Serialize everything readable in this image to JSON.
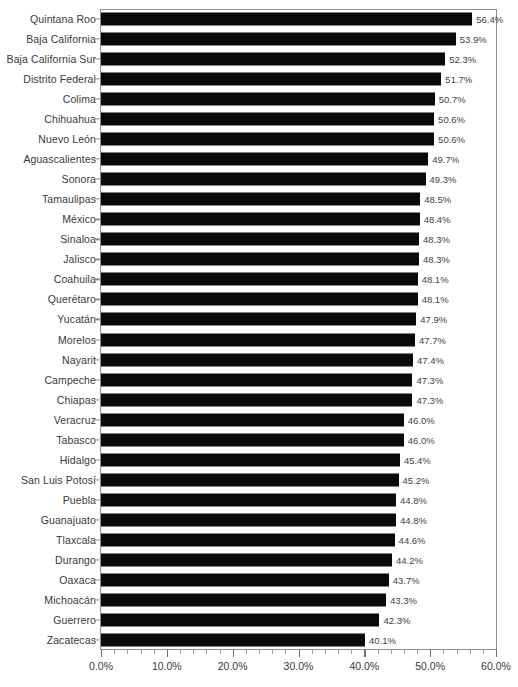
{
  "chart_data": {
    "type": "bar",
    "orientation": "horizontal",
    "title": "",
    "subtitle": "",
    "xlabel": "",
    "ylabel": "",
    "xlim": [
      0,
      60
    ],
    "grid": false,
    "legend": null,
    "value_suffix": "%",
    "xtick_labels": [
      "0.0%",
      "10.0%",
      "20.0%",
      "30.0%",
      "40.0%",
      "50.0%",
      "60.0%"
    ],
    "xtick_values": [
      0,
      10,
      20,
      30,
      40,
      50,
      60
    ],
    "minor_tick_step": 2,
    "bar_color": "#0a0a0a",
    "axis_color": "#8d8d8d",
    "text_color": "#3a3a3a",
    "categories": [
      "Quintana Roo",
      "Baja California",
      "Baja California Sur",
      "Distrito Federal",
      "Colima",
      "Chihuahua",
      "Nuevo León",
      "Aguascalientes",
      "Sonora",
      "Tamaulipas",
      "México",
      "Sinaloa",
      "Jalisco",
      "Coahuila",
      "Querétaro",
      "Yucatán",
      "Morelos",
      "Nayarit",
      "Campeche",
      "Chiapas",
      "Veracruz",
      "Tabasco",
      "Hidalgo",
      "San Luis Potosí",
      "Puebla",
      "Guanajuato",
      "Tlaxcala",
      "Durango",
      "Oaxaca",
      "Michoacán",
      "Guerrero",
      "Zacatecas"
    ],
    "values": [
      56.4,
      53.9,
      52.3,
      51.7,
      50.7,
      50.6,
      50.6,
      49.7,
      49.3,
      48.5,
      48.4,
      48.3,
      48.3,
      48.1,
      48.1,
      47.9,
      47.7,
      47.4,
      47.3,
      47.3,
      46.0,
      46.0,
      45.4,
      45.2,
      44.8,
      44.8,
      44.6,
      44.2,
      43.7,
      43.3,
      42.3,
      40.1
    ],
    "data_labels": [
      "56.4%",
      "53.9%",
      "52.3%",
      "51.7%",
      "50.7%",
      "50.6%",
      "50.6%",
      "49.7%",
      "49.3%",
      "48.5%",
      "48.4%",
      "48.3%",
      "48.3%",
      "48.1%",
      "48.1%",
      "47.9%",
      "47.7%",
      "47.4%",
      "47.3%",
      "47.3%",
      "46.0%",
      "46.0%",
      "45.4%",
      "45.2%",
      "44.8%",
      "44.8%",
      "44.6%",
      "44.2%",
      "43.7%",
      "43.3%",
      "42.3%",
      "40.1%"
    ]
  }
}
